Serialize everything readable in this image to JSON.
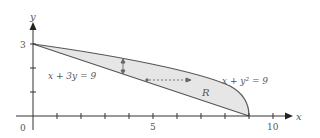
{
  "figure": {
    "axes": {
      "x_label": "x",
      "y_label": "y",
      "origin_label": "0",
      "x_tick_labels": [
        {
          "value": 5,
          "label": "5"
        },
        {
          "value": 10,
          "label": "10"
        }
      ],
      "y_tick_labels": [
        {
          "value": 3,
          "label": "3"
        }
      ],
      "x_range": [
        0,
        10.5
      ],
      "y_range": [
        0,
        3.8
      ]
    },
    "curves": [
      {
        "name": "line",
        "equation": "x + 3y = 9",
        "label": "x + 3y = 9"
      },
      {
        "name": "parabola",
        "equation": "x + y^2 = 9",
        "label": "x + y² = 9"
      }
    ],
    "region_label": "R",
    "colors": {
      "region_fill": "#e6e6e6",
      "curve": "#555555",
      "axis": "#333333",
      "arrow": "#666666"
    }
  }
}
